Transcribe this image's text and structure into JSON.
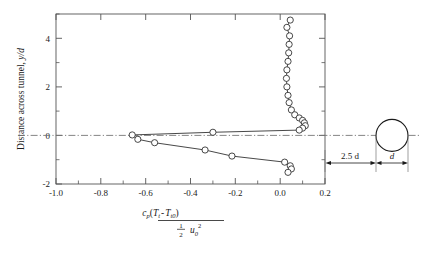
{
  "chart_data": {
    "type": "line",
    "title": "",
    "xlabel_latex": "c_p(T_t - T_t0) / (1/2 u_0^2)",
    "xlabel_parts": {
      "num_cp": "c",
      "num_cp_sub": "p",
      "num_open": "(",
      "num_T1": "T",
      "num_T1_sub": "t",
      "num_minus": "-",
      "num_T2": "T",
      "num_T2_sub": "t0",
      "num_close": ")",
      "den_half_top": "1",
      "den_half_bot": "2",
      "den_u": "u",
      "den_u_sub": "0",
      "den_u_sup": "2"
    },
    "ylabel_text": "Distance across tunnel, ",
    "ylabel_sym": "y/d",
    "xlim": [
      -1.0,
      0.2
    ],
    "ylim": [
      -2.0,
      5.0
    ],
    "xticks": [
      -1.0,
      -0.8,
      -0.6,
      -0.4,
      -0.2,
      0.0,
      0.2
    ],
    "xticklabels": [
      "-1.0",
      "-0.8",
      "-0.6",
      "-0.4",
      "-0.2",
      "0.0",
      "0.2"
    ],
    "xminorticks": [
      -0.9,
      -0.7,
      -0.5,
      -0.3,
      -0.1,
      0.1
    ],
    "yticks": [
      -2,
      0,
      2,
      4
    ],
    "yticklabels": [
      "-2",
      "0",
      "2",
      "4"
    ],
    "yminorticks": [
      -1,
      1,
      3,
      5
    ],
    "grid": false,
    "legend": null,
    "marker": "open-circle",
    "series": [
      {
        "name": "total temperature profile",
        "x": [
          0.045,
          0.03,
          0.042,
          0.04,
          0.038,
          0.035,
          0.03,
          0.028,
          0.03,
          0.035,
          0.04,
          0.05,
          0.065,
          0.085,
          0.1,
          0.108,
          0.112,
          0.1,
          0.085,
          -0.3,
          -0.66,
          -0.635,
          -0.56,
          -0.335,
          -0.215,
          0.02,
          0.045,
          0.05,
          0.035
        ],
        "y": [
          4.75,
          4.45,
          4.1,
          3.75,
          3.4,
          3.05,
          2.7,
          2.35,
          2.0,
          1.65,
          1.35,
          1.05,
          0.85,
          0.72,
          0.62,
          0.52,
          0.4,
          0.3,
          0.22,
          0.13,
          0.02,
          -0.16,
          -0.3,
          -0.6,
          -0.85,
          -1.1,
          -1.25,
          -1.38,
          -1.52
        ]
      }
    ],
    "centerline": {
      "y": 0,
      "style": "dash-dot"
    }
  },
  "inset": {
    "name": "cylinder-schematic",
    "cylinder_label": "d",
    "distance_label": "2.5 d",
    "shape": "circle"
  }
}
